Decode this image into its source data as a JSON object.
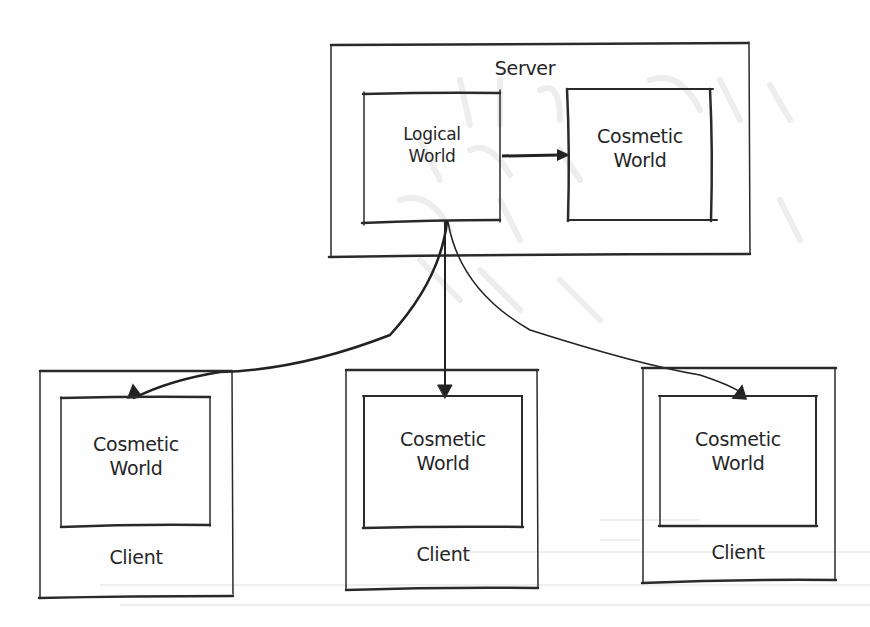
{
  "diagram": {
    "server": {
      "title": "Server",
      "logical_world": {
        "line1": "Logical",
        "line2": "World"
      },
      "cosmetic_world": {
        "line1": "Cosmetic",
        "line2": "World"
      }
    },
    "clients": [
      {
        "title": "Client",
        "cosmetic_world": {
          "line1": "Cosmetic",
          "line2": "World"
        }
      },
      {
        "title": "Client",
        "cosmetic_world": {
          "line1": "Cosmetic",
          "line2": "World"
        }
      },
      {
        "title": "Client",
        "cosmetic_world": {
          "line1": "Cosmetic",
          "line2": "World"
        }
      }
    ],
    "edges": [
      {
        "from": "Logical World",
        "to": "Cosmetic World (Server)"
      },
      {
        "from": "Logical World",
        "to": "Client 1 Cosmetic World"
      },
      {
        "from": "Logical World",
        "to": "Client 2 Cosmetic World"
      },
      {
        "from": "Logical World",
        "to": "Client 3 Cosmetic World"
      }
    ],
    "colors": {
      "ink": "#262626",
      "paper": "#fefefe",
      "bleed": "#ececec"
    }
  }
}
